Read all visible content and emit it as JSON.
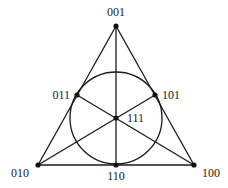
{
  "diagram": {
    "colors": {
      "line": "#1a1a1a",
      "point": "#111111",
      "label": "#222222",
      "background": "#ffffff"
    },
    "points": [
      {
        "id": "p001",
        "label": "001",
        "x": 116,
        "y": 26,
        "lx": 116,
        "ly": 16,
        "anchor": "middle"
      },
      {
        "id": "p011",
        "label": "011",
        "x": 77,
        "y": 95,
        "lx": 70,
        "ly": 99,
        "anchor": "end"
      },
      {
        "id": "p101",
        "label": "101",
        "x": 155,
        "y": 95,
        "lx": 162,
        "ly": 99,
        "anchor": "start"
      },
      {
        "id": "p111",
        "label": "111",
        "x": 116,
        "y": 118,
        "lx": 127,
        "ly": 122,
        "anchor": "start"
      },
      {
        "id": "p010",
        "label": "010",
        "x": 38,
        "y": 165,
        "lx": 29,
        "ly": 177,
        "anchor": "end"
      },
      {
        "id": "p110",
        "label": "110",
        "x": 116,
        "y": 165,
        "lx": 116,
        "ly": 180,
        "anchor": "middle"
      },
      {
        "id": "p100",
        "label": "100",
        "x": 194,
        "y": 165,
        "lx": 202,
        "ly": 177,
        "anchor": "start"
      }
    ],
    "lines": [
      {
        "from": "p001",
        "to": "p010"
      },
      {
        "from": "p001",
        "to": "p100"
      },
      {
        "from": "p010",
        "to": "p100"
      },
      {
        "from": "p001",
        "to": "p110"
      },
      {
        "from": "p010",
        "to": "p101"
      },
      {
        "from": "p100",
        "to": "p011"
      }
    ],
    "circle": {
      "cx": 116,
      "cy": 118,
      "r": 46
    }
  }
}
